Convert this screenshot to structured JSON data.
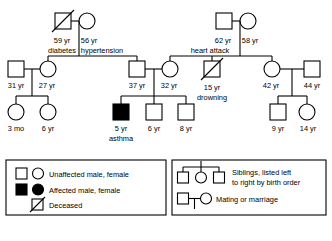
{
  "colors": {
    "stroke": "#000000",
    "unaffected_fill": "#ffffff",
    "affected_fill": "#000000",
    "background": "#ffffff"
  },
  "generations": {
    "gen1": {
      "couple_left": {
        "male": {
          "shape": "square",
          "status": "deceased",
          "affected": false,
          "age": "59 yr",
          "condition": "diabetes"
        },
        "female": {
          "shape": "circle",
          "status": "living",
          "affected": false,
          "age": "56 yr",
          "condition": "hypertension"
        }
      },
      "couple_right": {
        "male": {
          "shape": "square",
          "status": "living",
          "affected": false,
          "age": "62 yr",
          "condition": "heart attack"
        },
        "female": {
          "shape": "circle",
          "status": "living",
          "affected": false,
          "age": "58 yr",
          "condition": ""
        }
      }
    },
    "gen2": {
      "people": [
        {
          "shape": "square",
          "status": "living",
          "affected": false,
          "age": "31 yr",
          "condition": "",
          "role": "spouse-married-in"
        },
        {
          "shape": "circle",
          "status": "living",
          "affected": false,
          "age": "27 yr",
          "condition": "",
          "role": "child-of-couple-left"
        },
        {
          "shape": "square",
          "status": "living",
          "affected": false,
          "age": "37 yr",
          "condition": "",
          "role": "child-of-couple-left"
        },
        {
          "shape": "circle",
          "status": "living",
          "affected": false,
          "age": "32 yr",
          "condition": "",
          "role": "child-of-couple-right"
        },
        {
          "shape": "square",
          "status": "deceased",
          "affected": false,
          "age": "15 yr",
          "condition": "drowning",
          "role": "child-of-couple-right"
        },
        {
          "shape": "circle",
          "status": "living",
          "affected": false,
          "age": "42 yr",
          "condition": "",
          "role": "child-of-couple-right"
        },
        {
          "shape": "square",
          "status": "living",
          "affected": false,
          "age": "44 yr",
          "condition": "",
          "role": "spouse-married-in"
        }
      ]
    },
    "gen3": {
      "people": [
        {
          "shape": "circle",
          "status": "living",
          "affected": false,
          "age": "3 mo",
          "condition": ""
        },
        {
          "shape": "circle",
          "status": "living",
          "affected": false,
          "age": "6 yr",
          "condition": ""
        },
        {
          "shape": "square",
          "status": "living",
          "affected": true,
          "age": "5 yr",
          "condition": "asthma"
        },
        {
          "shape": "square",
          "status": "living",
          "affected": false,
          "age": "6 yr",
          "condition": ""
        },
        {
          "shape": "square",
          "status": "living",
          "affected": false,
          "age": "8 yr",
          "condition": ""
        },
        {
          "shape": "square",
          "status": "living",
          "affected": false,
          "age": "9 yr",
          "condition": ""
        },
        {
          "shape": "circle",
          "status": "living",
          "affected": false,
          "age": "14 yr",
          "condition": ""
        }
      ]
    }
  },
  "legend": {
    "rows": [
      {
        "key": "unaffected",
        "label": "Unaffected male, female"
      },
      {
        "key": "affected",
        "label": "Affected male, female"
      },
      {
        "key": "deceased",
        "label": "Deceased"
      },
      {
        "key": "siblings",
        "label_line1": "Siblings, listed left",
        "label_line2": "to right by birth order"
      },
      {
        "key": "mating",
        "label": "Mating or marriage"
      }
    ]
  }
}
